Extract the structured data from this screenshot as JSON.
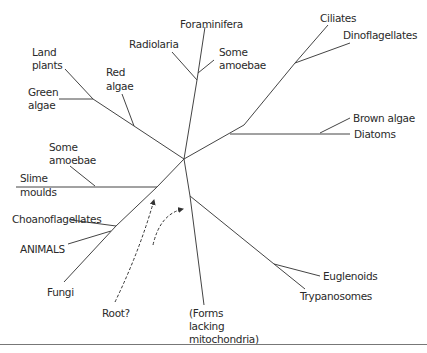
{
  "diagram": {
    "type": "unrooted phylogenetic tree of eukaryotes",
    "labels": {
      "foraminifera": "Foraminifera",
      "radiolaria": "Radiolaria",
      "some_amoebae_top_1": "Some",
      "some_amoebae_top_2": "amoebae",
      "ciliates": "Ciliates",
      "dinoflagellates": "Dinoflagellates",
      "land_plants_1": "Land",
      "land_plants_2": "plants",
      "red_algae_1": "Red",
      "red_algae_2": "algae",
      "green_algae_1": "Green",
      "green_algae_2": "algae",
      "brown_algae": "Brown algae",
      "diatoms": "Diatoms",
      "some_amoebae_left_1": "Some",
      "some_amoebae_left_2": "amoebae",
      "slime_moulds_1": "Slime",
      "slime_moulds_2": "moulds",
      "choanoflagellates": "Choanoflagellates",
      "animals": "ANIMALS",
      "fungi": "Fungi",
      "root": "Root?",
      "forms_lacking_1": "(Forms",
      "forms_lacking_2": "lacking",
      "forms_lacking_3": "mitochondria)",
      "euglenoids": "Euglenoids",
      "trypanosomes": "Trypanosomes"
    },
    "colors": {
      "line": "#444444",
      "text": "#2a2a2a",
      "background": "#ffffff"
    }
  }
}
